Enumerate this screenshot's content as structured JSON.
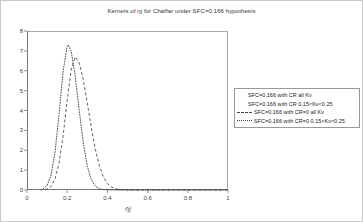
{
  "figure": {
    "title": "Kernels of ηj for Chaffar under SFC=0.166 hypothesis",
    "xlabel": "ηj"
  },
  "chart_data": {
    "type": "line",
    "title": "Kernels of ηj for Chaffar under SFC=0.166 hypothesis",
    "xlabel": "ηj",
    "ylabel": "",
    "xlim": [
      0,
      1
    ],
    "ylim": [
      0,
      8
    ],
    "grid": false,
    "legend_position": "right-outside-middle",
    "xticks": [
      0,
      0.2,
      0.4,
      0.6,
      0.8,
      1
    ],
    "yticks": [
      0,
      1,
      2,
      3,
      4,
      5,
      6,
      7,
      8
    ],
    "xtick_labels": [
      "0",
      "0.2",
      "0.4",
      "0.6",
      "0.8",
      "1"
    ],
    "ytick_labels": [
      "0",
      "1",
      "2",
      "3",
      "4",
      "5",
      "6",
      "7",
      "8"
    ],
    "series": [
      {
        "name": "SFC=0.166 with CR all Kv",
        "style": "none",
        "note": "legend entry with no visible line sample; curve not visibly distinct in plot",
        "points": []
      },
      {
        "name": "SFC=0.166 with CR  0.15<Kv<0.25",
        "style": "none",
        "note": "legend entry with no visible line sample; curve not visibly distinct in plot",
        "points": []
      },
      {
        "name": "SFC=0.166 with CR=0 all Kv",
        "style": "dashed",
        "peak": {
          "x": 0.24,
          "y": 6.7
        },
        "points": [
          [
            0.09,
            0
          ],
          [
            0.1,
            0.05
          ],
          [
            0.12,
            0.19
          ],
          [
            0.14,
            0.57
          ],
          [
            0.16,
            1.38
          ],
          [
            0.18,
            2.75
          ],
          [
            0.2,
            4.51
          ],
          [
            0.22,
            6.07
          ],
          [
            0.24,
            6.7
          ],
          [
            0.26,
            6.39
          ],
          [
            0.28,
            5.55
          ],
          [
            0.3,
            4.37
          ],
          [
            0.32,
            3.14
          ],
          [
            0.34,
            2.05
          ],
          [
            0.36,
            1.22
          ],
          [
            0.38,
            0.66
          ],
          [
            0.4,
            0.32
          ],
          [
            0.42,
            0.15
          ],
          [
            0.44,
            0.06
          ],
          [
            0.46,
            0.02
          ],
          [
            0.5,
            0
          ],
          [
            0.6,
            0
          ],
          [
            0.7,
            0
          ],
          [
            0.8,
            0
          ],
          [
            0.9,
            0
          ],
          [
            1.0,
            0
          ]
        ]
      },
      {
        "name": "SFC=0.166 with CR=0  0.15<Kv<0.25",
        "style": "dotted",
        "peak": {
          "x": 0.205,
          "y": 7.3
        },
        "points": [
          [
            0.07,
            0
          ],
          [
            0.08,
            0.06
          ],
          [
            0.1,
            0.23
          ],
          [
            0.12,
            0.76
          ],
          [
            0.14,
            1.95
          ],
          [
            0.16,
            3.88
          ],
          [
            0.18,
            6.0
          ],
          [
            0.2,
            7.24
          ],
          [
            0.205,
            7.3
          ],
          [
            0.22,
            6.98
          ],
          [
            0.24,
            5.71
          ],
          [
            0.26,
            3.99
          ],
          [
            0.28,
            2.37
          ],
          [
            0.3,
            1.2
          ],
          [
            0.32,
            0.52
          ],
          [
            0.34,
            0.19
          ],
          [
            0.36,
            0.06
          ],
          [
            0.38,
            0.02
          ],
          [
            0.4,
            0.01
          ],
          [
            0.45,
            0
          ],
          [
            0.5,
            0
          ],
          [
            0.6,
            0
          ],
          [
            0.7,
            0
          ],
          [
            0.8,
            0
          ],
          [
            0.9,
            0
          ],
          [
            1.0,
            0
          ]
        ]
      }
    ]
  },
  "legend": {
    "entries": [
      {
        "label": "SFC=0.166 with CR all Kv",
        "sample": "none"
      },
      {
        "label": "SFC=0.166 with CR  0.15<Kv<0.25",
        "sample": "none"
      },
      {
        "label": "SFC=0.166 with CR=0 all Kv",
        "sample": "dashed"
      },
      {
        "label": "SFC=0.166 with CR=0  0.15<Kv<0.25",
        "sample": "dotted"
      }
    ]
  },
  "colors": {
    "curve": "#3a3a3a",
    "frame": "#aaaaaa",
    "axis": "#777777",
    "tick": "#777777",
    "text": "#333333",
    "legend_border": "#999999",
    "background": "#ffffff"
  }
}
